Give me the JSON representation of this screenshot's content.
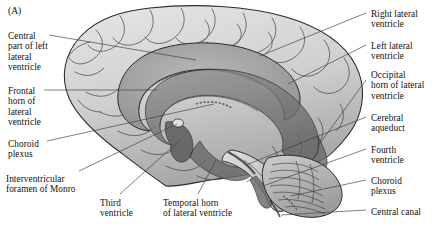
{
  "figure": {
    "panel_label": "(A)",
    "background_color": "#ffffff",
    "ink_color": "#111111",
    "leader_line_color": "#3a3a3a"
  },
  "labels": {
    "left": [
      {
        "id": "central-part-left-lateral-ventricle",
        "text": "Central\npart of left\nlateral\nventricle",
        "x": 8,
        "y": 31
      },
      {
        "id": "frontal-horn-lateral-ventricle",
        "text": "Frontal\nhorn of\nlateral\nventricle",
        "x": 8,
        "y": 86
      },
      {
        "id": "choroid-plexus-left",
        "text": "Choroid\nplexus",
        "x": 8,
        "y": 139
      },
      {
        "id": "interventricular-foramen-of-monro",
        "text": "Interventricular\nforamen of Monro",
        "x": 6,
        "y": 174
      }
    ],
    "bottom": [
      {
        "id": "third-ventricle",
        "text": "Third\nventricle",
        "x": 100,
        "y": 198
      },
      {
        "id": "temporal-horn-lateral-ventricle",
        "text": "Temporal horn\nof  lateral ventricle",
        "x": 163,
        "y": 198
      }
    ],
    "right": [
      {
        "id": "right-lateral-ventricle",
        "text": "Right lateral\nventricle",
        "x": 371,
        "y": 9
      },
      {
        "id": "left-lateral-ventricle",
        "text": "Left lateral\nventricle",
        "x": 371,
        "y": 41
      },
      {
        "id": "occipital-horn-lateral-ventricle",
        "text": "Occipital\nhorn of lateral\nventricle",
        "x": 371,
        "y": 70
      },
      {
        "id": "cerebral-aqueduct",
        "text": "Cerebral\naqueduct",
        "x": 371,
        "y": 113
      },
      {
        "id": "fourth-ventricle",
        "text": "Fourth\nventricle",
        "x": 371,
        "y": 145
      },
      {
        "id": "choroid-plexus-right",
        "text": "Choroid\nplexus",
        "x": 371,
        "y": 176
      },
      {
        "id": "central-canal",
        "text": "Central canal",
        "x": 371,
        "y": 207
      }
    ]
  },
  "palette": {
    "cortex_light": "#dcdcdc",
    "cortex_mid": "#c2c2c2",
    "cortex_shade": "#a6a6a6",
    "ventricle_dark": "#6f6f6f",
    "ventricle_mid": "#8c8c8c",
    "outline": "#2b2b2b",
    "cerebellum": "#b8b8b8"
  }
}
